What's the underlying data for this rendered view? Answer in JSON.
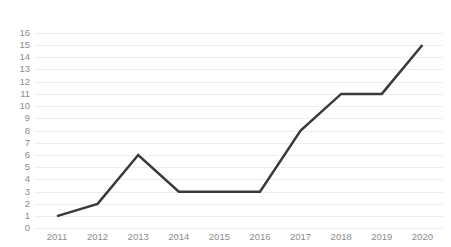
{
  "chart_data": {
    "type": "line",
    "title": "",
    "subtitle": "",
    "xlabel": "",
    "ylabel": "",
    "categories": [
      "2011",
      "2012",
      "2013",
      "2014",
      "2015",
      "2016",
      "2017",
      "2018",
      "2019",
      "2020"
    ],
    "values": [
      1,
      2,
      6,
      3,
      3,
      3,
      8,
      11,
      11,
      15
    ],
    "series": [
      {
        "name": "",
        "values": [
          1,
          2,
          6,
          3,
          3,
          3,
          8,
          11,
          11,
          15
        ],
        "color": "#3a3a3a"
      }
    ],
    "ylim": [
      0,
      16
    ],
    "ytick_values": [
      0,
      1,
      2,
      3,
      4,
      5,
      6,
      7,
      8,
      9,
      10,
      11,
      12,
      13,
      14,
      15,
      16
    ],
    "ytick_labels": [
      "0",
      "1",
      "2",
      "3",
      "4",
      "5",
      "6",
      "7",
      "8",
      "9",
      "10",
      "11",
      "12",
      "13",
      "14",
      "15",
      "16"
    ],
    "xtick_labels": [
      "2011",
      "2012",
      "2013",
      "2014",
      "2015",
      "2016",
      "2017",
      "2018",
      "2019",
      "2020"
    ],
    "grid": true,
    "grid_axis": "y",
    "legend": false,
    "legend_position": "none",
    "markers": false,
    "annotations": [],
    "colors": {
      "line": "#3a3a3a",
      "gridline": "#ededed",
      "tick_label": "#8c8c8c",
      "background": "#ffffff"
    }
  }
}
